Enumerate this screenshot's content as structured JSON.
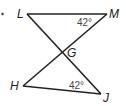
{
  "diagram": {
    "bullet": "•",
    "points": {
      "L": {
        "label": "L",
        "x": 27,
        "y": 14
      },
      "M": {
        "label": "M",
        "x": 107,
        "y": 14
      },
      "G": {
        "label": "G",
        "x": 61,
        "y": 52
      },
      "H": {
        "label": "H",
        "x": 23,
        "y": 86
      },
      "J": {
        "label": "J",
        "x": 101,
        "y": 94
      }
    },
    "angles": {
      "M": "42°",
      "J": "42°"
    },
    "segments": [
      "LM",
      "LJ",
      "MH",
      "HJ"
    ]
  }
}
